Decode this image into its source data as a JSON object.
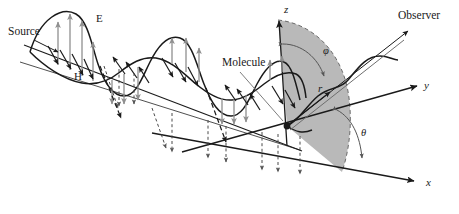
{
  "figure": {
    "background_color": "#ffffff",
    "width": 459,
    "height": 214
  },
  "colors": {
    "stroke": "#1a1a1a",
    "e_field_arrow": "#8f8f8f",
    "h_field_arrow": "#1a1a1a",
    "sector_fill": "#b5b5b5",
    "sector_edge": "#555555",
    "background": "#ffffff",
    "text": "#1a1a1a"
  },
  "labels": {
    "source": "Source",
    "e_field": "E",
    "h_field": "H",
    "molecule": "Molecule",
    "observer": "Observer",
    "axis_z": "z",
    "axis_y": "y",
    "axis_x": "x",
    "angle_phi": "φ",
    "angle_theta": "θ",
    "radius": "r"
  },
  "label_positions": {
    "source": {
      "x": 8,
      "y": 35
    },
    "e_field": {
      "x": 96,
      "y": 22
    },
    "h_field": {
      "x": 74,
      "y": 80
    },
    "molecule": {
      "x": 222,
      "y": 66
    },
    "observer": {
      "x": 398,
      "y": 19
    },
    "axis_z": {
      "x": 284,
      "y": 13
    },
    "axis_y": {
      "x": 424,
      "y": 89
    },
    "axis_x": {
      "x": 426,
      "y": 186
    },
    "angle_phi": {
      "x": 323,
      "y": 54
    },
    "angle_theta": {
      "x": 361,
      "y": 136
    },
    "radius": {
      "x": 318,
      "y": 92
    }
  },
  "geometry": {
    "origin": {
      "x": 287,
      "y": 126
    },
    "axis_z_tip": {
      "x": 278,
      "y": 18
    },
    "axis_y_tip": {
      "x": 418,
      "y": 86
    },
    "axis_x_tip": {
      "x": 415,
      "y": 181
    },
    "observer_ray_tip": {
      "x": 409,
      "y": 30
    },
    "propagation_start": {
      "x": 22,
      "y": 44
    },
    "propagation_end": {
      "x": 300,
      "y": 150
    }
  },
  "elements": {
    "incident_wave": {
      "name": "incident electromagnetic wave",
      "components": [
        "E field (vertical, gray arrows)",
        "H field (transverse, black arrows)"
      ],
      "lobe_count": 4,
      "dashed_projection_lines": true
    },
    "scattered_wave": {
      "name": "scattered wave toward observer",
      "style": "curved black line following the observer ray"
    },
    "shaded_sector": {
      "name": "spherical sector between z axis and radius vector",
      "fill": "#b5b5b5",
      "edge_style": "dashed arc"
    },
    "angle_arcs": [
      {
        "name": "phi",
        "from": "z-axis",
        "to": "radius r"
      },
      {
        "name": "theta",
        "from": "x-axis",
        "to": "radius r"
      }
    ]
  }
}
